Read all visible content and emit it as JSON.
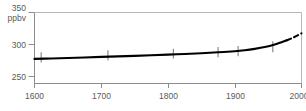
{
  "chart_data": {
    "type": "line",
    "title": "",
    "subtitle": "",
    "xlabel": "",
    "ylabel": "ppbv",
    "ylabel_unit": "ppbv",
    "xlim": [
      1600,
      2000
    ],
    "ylim": [
      250,
      350
    ],
    "grid": false,
    "legend": null,
    "y_ticks": [
      "350",
      "300",
      "250"
    ],
    "y_tick_values": [
      350,
      300,
      250
    ],
    "x_ticks": [
      "1600",
      "1700",
      "1800",
      "1900",
      "2000"
    ],
    "x_tick_values": [
      1600,
      1700,
      1800,
      1900,
      2000
    ],
    "series": [
      {
        "name": "observed",
        "style": "solid",
        "x": [
          1600,
          1625,
          1650,
          1675,
          1700,
          1725,
          1750,
          1775,
          1800,
          1825,
          1850,
          1875,
          1900,
          1915,
          1930,
          1945,
          1960,
          1970,
          1978
        ],
        "values": [
          277.5,
          278.2,
          279.0,
          279.8,
          280.6,
          281.4,
          282.3,
          283.2,
          284.2,
          285.2,
          286.4,
          287.8,
          289.5,
          291.0,
          293.2,
          296.0,
          300.0,
          303.5,
          306.5
        ]
      },
      {
        "name": "projected",
        "style": "dashed",
        "x": [
          1978,
          1985,
          1992,
          2000
        ],
        "values": [
          306.5,
          309.5,
          313.0,
          317.5
        ]
      }
    ],
    "error_bars": [
      {
        "x": 1610,
        "low": 272.0,
        "high": 288.0
      },
      {
        "x": 1710,
        "low": 275.0,
        "high": 291.0
      },
      {
        "x": 1808,
        "low": 278.0,
        "high": 293.5
      },
      {
        "x": 1875,
        "low": 280.0,
        "high": 296.0
      },
      {
        "x": 1905,
        "low": 281.5,
        "high": 297.5
      },
      {
        "x": 1957,
        "low": 288.0,
        "high": 305.0
      }
    ],
    "axis_color": "#808080",
    "line_color": "#000000",
    "errorbar_color": "#808080",
    "text_color": "#5a5a5a"
  }
}
